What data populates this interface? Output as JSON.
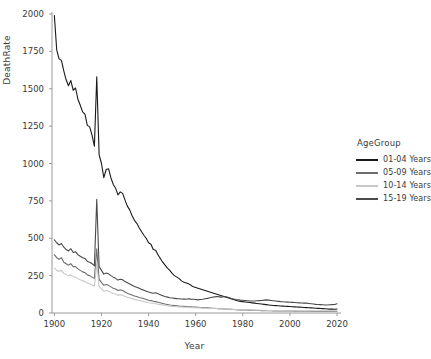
{
  "chart_data": {
    "type": "line",
    "title": "",
    "xlabel": "Year",
    "ylabel": "DeathRate",
    "xlim": [
      1899,
      2020
    ],
    "ylim": [
      0,
      2000
    ],
    "xticks": [
      1900,
      1920,
      1940,
      1960,
      1980,
      2000,
      2020
    ],
    "yticks": [
      0,
      250,
      500,
      750,
      1000,
      1250,
      1500,
      1750,
      2000
    ],
    "grid": false,
    "legend_position": "right",
    "legend_title": "AgeGroup",
    "background": "#ffffff",
    "series": [
      {
        "name": "01-04 Years",
        "color": "#1a1a1a",
        "x": [
          1900,
          1901,
          1902,
          1903,
          1904,
          1905,
          1906,
          1907,
          1908,
          1909,
          1910,
          1911,
          1912,
          1913,
          1914,
          1915,
          1916,
          1917,
          1918,
          1919,
          1920,
          1921,
          1922,
          1923,
          1924,
          1925,
          1926,
          1927,
          1928,
          1929,
          1930,
          1931,
          1932,
          1933,
          1934,
          1935,
          1936,
          1937,
          1938,
          1939,
          1940,
          1941,
          1942,
          1943,
          1944,
          1945,
          1946,
          1947,
          1948,
          1949,
          1950,
          1951,
          1952,
          1953,
          1954,
          1955,
          1956,
          1957,
          1958,
          1959,
          1960,
          1961,
          1962,
          1963,
          1964,
          1965,
          1966,
          1967,
          1968,
          1969,
          1970,
          1971,
          1972,
          1973,
          1974,
          1975,
          1976,
          1977,
          1978,
          1979,
          1980,
          1981,
          1982,
          1983,
          1984,
          1985,
          1986,
          1987,
          1988,
          1989,
          1990,
          1991,
          1992,
          1993,
          1994,
          1995,
          1996,
          1997,
          1998,
          1999,
          2000,
          2001,
          2002,
          2003,
          2004,
          2005,
          2006,
          2007,
          2008,
          2009,
          2010,
          2011,
          2012,
          2013,
          2014,
          2015,
          2016,
          2017,
          2018,
          2019,
          2020
        ],
        "y": [
          1990,
          1760,
          1700,
          1690,
          1620,
          1560,
          1520,
          1555,
          1490,
          1505,
          1430,
          1390,
          1345,
          1330,
          1255,
          1245,
          1190,
          1115,
          1580,
          1060,
          1000,
          905,
          960,
          965,
          905,
          860,
          835,
          790,
          810,
          800,
          755,
          715,
          690,
          650,
          620,
          600,
          570,
          545,
          520,
          500,
          470,
          460,
          425,
          420,
          390,
          365,
          340,
          320,
          300,
          285,
          265,
          250,
          240,
          230,
          215,
          205,
          200,
          195,
          185,
          175,
          170,
          165,
          160,
          155,
          150,
          145,
          140,
          135,
          130,
          125,
          120,
          115,
          110,
          105,
          100,
          95,
          90,
          85,
          80,
          78,
          76,
          74,
          72,
          70,
          68,
          66,
          64,
          62,
          60,
          58,
          56,
          54,
          52,
          50,
          49,
          48,
          47,
          46,
          45,
          44,
          43,
          42,
          41,
          40,
          39,
          38,
          37,
          36,
          35,
          34,
          33,
          32,
          31,
          30,
          29,
          28,
          27,
          26,
          26,
          25,
          27
        ]
      },
      {
        "name": "05-09 Years",
        "color": "#6e6e6e",
        "x": [
          1900,
          1901,
          1902,
          1903,
          1904,
          1905,
          1906,
          1907,
          1908,
          1909,
          1910,
          1911,
          1912,
          1913,
          1914,
          1915,
          1916,
          1917,
          1918,
          1919,
          1920,
          1921,
          1922,
          1923,
          1924,
          1925,
          1926,
          1927,
          1928,
          1929,
          1930,
          1931,
          1932,
          1933,
          1934,
          1935,
          1936,
          1937,
          1938,
          1939,
          1940,
          1941,
          1942,
          1943,
          1944,
          1945,
          1946,
          1947,
          1948,
          1949,
          1950,
          1951,
          1952,
          1953,
          1954,
          1955,
          1956,
          1957,
          1958,
          1959,
          1960,
          1961,
          1962,
          1963,
          1964,
          1965,
          1966,
          1967,
          1968,
          1969,
          1970,
          1971,
          1972,
          1973,
          1974,
          1975,
          1976,
          1977,
          1978,
          1979,
          1980,
          1981,
          1982,
          1983,
          1984,
          1985,
          1986,
          1987,
          1988,
          1989,
          1990,
          1991,
          1992,
          1993,
          1994,
          1995,
          1996,
          1997,
          1998,
          1999,
          2000,
          2001,
          2002,
          2003,
          2004,
          2005,
          2006,
          2007,
          2008,
          2009,
          2010,
          2011,
          2012,
          2013,
          2014,
          2015,
          2016,
          2017,
          2018,
          2019,
          2020
        ],
        "y": [
          390,
          370,
          360,
          370,
          340,
          330,
          320,
          330,
          310,
          310,
          295,
          285,
          275,
          270,
          255,
          250,
          240,
          230,
          430,
          225,
          205,
          185,
          190,
          185,
          175,
          165,
          160,
          150,
          155,
          150,
          140,
          132,
          126,
          120,
          114,
          110,
          104,
          100,
          95,
          90,
          85,
          83,
          78,
          76,
          72,
          68,
          64,
          60,
          57,
          54,
          52,
          50,
          48,
          46,
          45,
          44,
          43,
          42,
          41,
          40,
          39,
          38,
          37,
          36,
          35,
          34,
          33,
          32,
          31,
          30,
          29,
          28,
          27,
          26,
          25,
          24,
          23,
          22,
          21,
          21,
          20,
          20,
          19,
          19,
          18,
          18,
          17,
          17,
          16,
          16,
          15,
          15,
          15,
          14,
          14,
          14,
          14,
          13,
          13,
          13,
          13,
          13,
          12,
          12,
          12,
          12,
          12,
          12,
          12,
          11,
          11,
          11,
          11,
          11,
          11,
          11,
          11,
          11,
          11,
          11,
          12
        ]
      },
      {
        "name": "10-14 Years",
        "color": "#c8c8c8",
        "x": [
          1900,
          1901,
          1902,
          1903,
          1904,
          1905,
          1906,
          1907,
          1908,
          1909,
          1910,
          1911,
          1912,
          1913,
          1914,
          1915,
          1916,
          1917,
          1918,
          1919,
          1920,
          1921,
          1922,
          1923,
          1924,
          1925,
          1926,
          1927,
          1928,
          1929,
          1930,
          1931,
          1932,
          1933,
          1934,
          1935,
          1936,
          1937,
          1938,
          1939,
          1940,
          1941,
          1942,
          1943,
          1944,
          1945,
          1946,
          1947,
          1948,
          1949,
          1950,
          1951,
          1952,
          1953,
          1954,
          1955,
          1956,
          1957,
          1958,
          1959,
          1960,
          1961,
          1962,
          1963,
          1964,
          1965,
          1966,
          1967,
          1968,
          1969,
          1970,
          1971,
          1972,
          1973,
          1974,
          1975,
          1976,
          1977,
          1978,
          1979,
          1980,
          1981,
          1982,
          1983,
          1984,
          1985,
          1986,
          1987,
          1988,
          1989,
          1990,
          1991,
          1992,
          1993,
          1994,
          1995,
          1996,
          1997,
          1998,
          1999,
          2000,
          2001,
          2002,
          2003,
          2004,
          2005,
          2006,
          2007,
          2008,
          2009,
          2010,
          2011,
          2012,
          2013,
          2014,
          2015,
          2016,
          2017,
          2018,
          2019,
          2020
        ],
        "y": [
          300,
          285,
          280,
          285,
          265,
          258,
          250,
          255,
          242,
          240,
          230,
          222,
          215,
          210,
          200,
          196,
          188,
          180,
          330,
          176,
          162,
          146,
          150,
          146,
          138,
          130,
          126,
          118,
          122,
          118,
          110,
          105,
          100,
          96,
          91,
          88,
          84,
          80,
          76,
          73,
          69,
          67,
          64,
          62,
          59,
          56,
          53,
          50,
          48,
          46,
          44,
          43,
          42,
          41,
          40,
          39,
          38,
          38,
          37,
          36,
          35,
          34,
          34,
          33,
          32,
          32,
          31,
          30,
          30,
          29,
          28,
          28,
          27,
          26,
          26,
          25,
          24,
          23,
          23,
          22,
          22,
          21,
          21,
          20,
          20,
          19,
          19,
          19,
          18,
          18,
          18,
          17,
          17,
          17,
          16,
          16,
          16,
          16,
          15,
          15,
          15,
          15,
          15,
          14,
          14,
          14,
          14,
          14,
          14,
          13,
          13,
          13,
          13,
          13,
          13,
          13,
          13,
          13,
          13,
          13,
          14
        ]
      },
      {
        "name": "15-19 Years",
        "color": "#4a4a4a",
        "x": [
          1900,
          1901,
          1902,
          1903,
          1904,
          1905,
          1906,
          1907,
          1908,
          1909,
          1910,
          1911,
          1912,
          1913,
          1914,
          1915,
          1916,
          1917,
          1918,
          1919,
          1920,
          1921,
          1922,
          1923,
          1924,
          1925,
          1926,
          1927,
          1928,
          1929,
          1930,
          1931,
          1932,
          1933,
          1934,
          1935,
          1936,
          1937,
          1938,
          1939,
          1940,
          1941,
          1942,
          1943,
          1944,
          1945,
          1946,
          1947,
          1948,
          1949,
          1950,
          1951,
          1952,
          1953,
          1954,
          1955,
          1956,
          1957,
          1958,
          1959,
          1960,
          1961,
          1962,
          1963,
          1964,
          1965,
          1966,
          1967,
          1968,
          1969,
          1970,
          1971,
          1972,
          1973,
          1974,
          1975,
          1976,
          1977,
          1978,
          1979,
          1980,
          1981,
          1982,
          1983,
          1984,
          1985,
          1986,
          1987,
          1988,
          1989,
          1990,
          1991,
          1992,
          1993,
          1994,
          1995,
          1996,
          1997,
          1998,
          1999,
          2000,
          2001,
          2002,
          2003,
          2004,
          2005,
          2006,
          2007,
          2008,
          2009,
          2010,
          2011,
          2012,
          2013,
          2014,
          2015,
          2016,
          2017,
          2018,
          2019,
          2020
        ],
        "y": [
          490,
          470,
          455,
          465,
          440,
          425,
          415,
          430,
          405,
          410,
          390,
          380,
          370,
          365,
          345,
          340,
          330,
          315,
          760,
          310,
          285,
          260,
          268,
          262,
          250,
          240,
          232,
          220,
          226,
          222,
          210,
          202,
          194,
          186,
          178,
          172,
          165,
          158,
          152,
          146,
          140,
          136,
          132,
          135,
          128,
          122,
          116,
          110,
          106,
          102,
          100,
          98,
          96,
          95,
          94,
          93,
          92,
          95,
          93,
          92,
          90,
          88,
          90,
          92,
          95,
          98,
          102,
          105,
          108,
          110,
          108,
          106,
          110,
          108,
          104,
          98,
          94,
          90,
          88,
          86,
          85,
          84,
          82,
          80,
          80,
          80,
          82,
          83,
          84,
          86,
          88,
          86,
          84,
          82,
          80,
          78,
          76,
          75,
          74,
          73,
          72,
          71,
          70,
          69,
          68,
          67,
          66,
          66,
          64,
          62,
          60,
          58,
          57,
          56,
          55,
          54,
          54,
          55,
          56,
          57,
          62
        ]
      }
    ]
  },
  "axes": {
    "y_ticks": [
      "0",
      "250",
      "500",
      "750",
      "1000",
      "1250",
      "1500",
      "1750",
      "2000"
    ],
    "x_ticks": [
      "1900",
      "1920",
      "1940",
      "1960",
      "1980",
      "2000",
      "2020"
    ],
    "y_title": "DeathRate",
    "x_title": "Year"
  },
  "legend": {
    "title": "AgeGroup",
    "items": [
      {
        "label": "01-04 Years",
        "color": "#1a1a1a"
      },
      {
        "label": "05-09 Years",
        "color": "#6e6e6e"
      },
      {
        "label": "10-14 Years",
        "color": "#c8c8c8"
      },
      {
        "label": "15-19 Years",
        "color": "#4a4a4a"
      }
    ]
  }
}
